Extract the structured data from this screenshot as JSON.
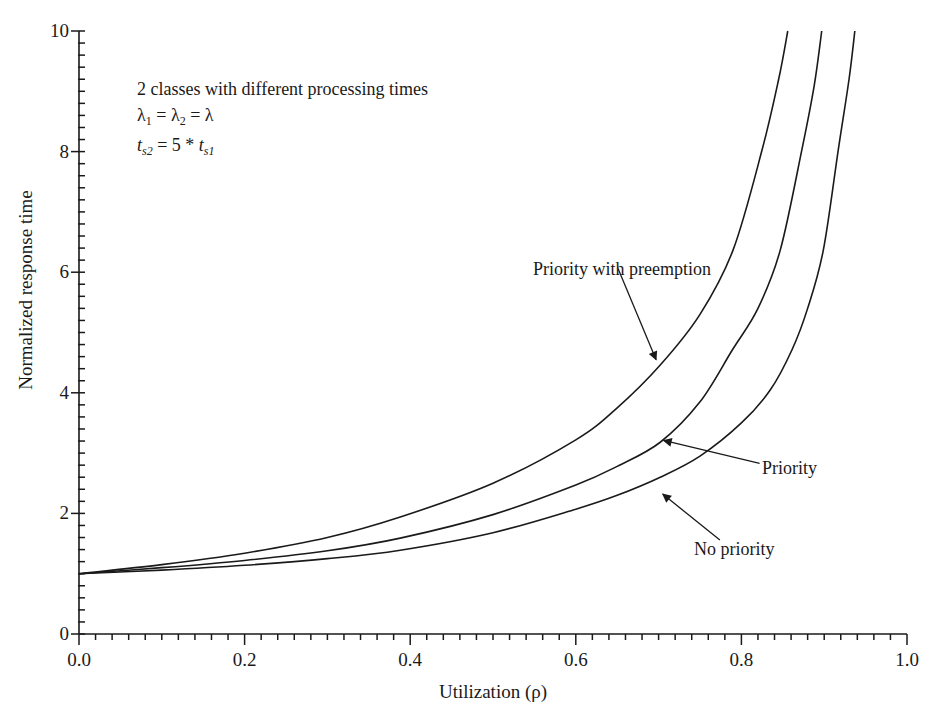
{
  "chart_data": {
    "type": "line",
    "title": "",
    "xlabel": "Utilization (ρ)",
    "ylabel": "Normalized response time",
    "xlim": [
      0.0,
      1.0
    ],
    "ylim": [
      0,
      10
    ],
    "grid": false,
    "legend": "none (curves labeled with arrows)",
    "x_ticks": [
      "0.0",
      "0.2",
      "0.4",
      "0.6",
      "0.8",
      "1.0"
    ],
    "y_ticks": [
      "0",
      "2",
      "4",
      "6",
      "8",
      "10"
    ],
    "x_minor_step": 0.02,
    "y_minor_step": 0.2,
    "annotation_block": {
      "line1": "2 classes with different processing times",
      "line2": "λ₁ = λ₂ = λ",
      "line3": "ts2 = 5 * ts1"
    },
    "series": [
      {
        "name": "Priority with preemption",
        "x": [
          0.0,
          0.1,
          0.2,
          0.3,
          0.388,
          0.5,
          0.6,
          0.65,
          0.702,
          0.75,
          0.79,
          0.825,
          0.845,
          0.856
        ],
        "y": [
          1.0,
          1.15,
          1.34,
          1.6,
          1.94,
          2.5,
          3.22,
          3.75,
          4.46,
          5.3,
          6.37,
          8.03,
          9.2,
          10.0
        ]
      },
      {
        "name": "Priority",
        "x": [
          0.0,
          0.1,
          0.2,
          0.3,
          0.388,
          0.5,
          0.6,
          0.65,
          0.702,
          0.75,
          0.789,
          0.82,
          0.847,
          0.873,
          0.888,
          0.897
        ],
        "y": [
          1.0,
          1.1,
          1.22,
          1.38,
          1.59,
          1.98,
          2.47,
          2.78,
          3.18,
          3.85,
          4.71,
          5.4,
          6.37,
          8.03,
          9.1,
          10.0
        ]
      },
      {
        "name": "No priority",
        "x": [
          0.0,
          0.1,
          0.2,
          0.3,
          0.388,
          0.5,
          0.6,
          0.65,
          0.702,
          0.75,
          0.8,
          0.835,
          0.861,
          0.88,
          0.899,
          0.917,
          0.93,
          0.937
        ],
        "y": [
          1.0,
          1.06,
          1.14,
          1.25,
          1.39,
          1.68,
          2.07,
          2.3,
          2.6,
          2.95,
          3.5,
          4.05,
          4.71,
          5.4,
          6.37,
          8.03,
          9.2,
          10.0
        ]
      }
    ],
    "arrows": [
      {
        "label": "Priority with preemption",
        "from": [
          0.651,
          6.06
        ],
        "to": [
          0.697,
          4.55
        ]
      },
      {
        "label": "Priority",
        "from": [
          0.822,
          2.83
        ],
        "to": [
          0.706,
          3.21
        ]
      },
      {
        "label": "No priority",
        "from": [
          0.774,
          1.56
        ],
        "to": [
          0.705,
          2.32
        ]
      }
    ]
  }
}
